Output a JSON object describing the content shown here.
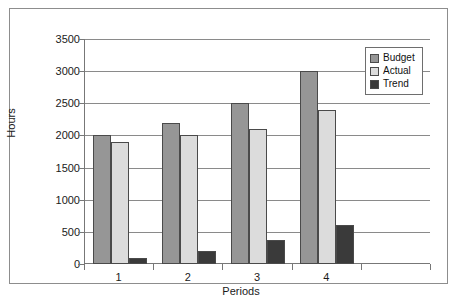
{
  "chart_data": {
    "type": "bar",
    "title": "",
    "xlabel": "Periods",
    "ylabel": "Hours",
    "categories": [
      "1",
      "2",
      "3",
      "4"
    ],
    "series": [
      {
        "name": "Budget",
        "color": "#969696",
        "values": [
          2000,
          2200,
          2500,
          3000
        ]
      },
      {
        "name": "Actual",
        "color": "#dcdcdc",
        "values": [
          1900,
          2000,
          2100,
          2400
        ]
      },
      {
        "name": "Trend",
        "color": "#3a3a3a",
        "values": [
          100,
          200,
          380,
          600
        ]
      }
    ],
    "ylim": [
      0,
      3500
    ],
    "yticks": [
      0,
      500,
      1000,
      1500,
      2000,
      2500,
      3000,
      3500
    ],
    "ytick_labels": [
      "0",
      "500",
      "1000",
      "1500",
      "2000",
      "2500",
      "3000",
      "3500"
    ],
    "grid": true,
    "legend_position": "top-right"
  },
  "legend": {
    "entries": [
      {
        "label": "Budget",
        "color": "#969696"
      },
      {
        "label": "Actual",
        "color": "#dcdcdc"
      },
      {
        "label": "Trend",
        "color": "#3a3a3a"
      }
    ]
  }
}
